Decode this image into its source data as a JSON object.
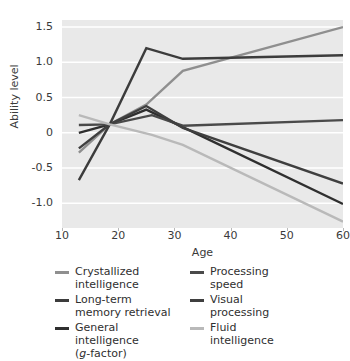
{
  "chart_data": {
    "type": "line",
    "title": "",
    "xlabel": "Age",
    "ylabel": "Ability level",
    "xlim": [
      10,
      60
    ],
    "ylim": [
      -1.35,
      1.6
    ],
    "xticks": [
      10,
      20,
      30,
      40,
      50,
      60
    ],
    "yticks": [
      1.5,
      1.0,
      0.5,
      0,
      -0.5,
      -1.0
    ],
    "ytick_labels": [
      "1.5",
      "1.0",
      "0.5",
      "0",
      "-0.5",
      "-1.0"
    ],
    "xtick_labels": [
      "10",
      "20",
      "30",
      "40",
      "50",
      "60"
    ],
    "grid": "horizontal-white-on-gray",
    "legend_position": "below-plot-two-columns",
    "plot_background": "#e9e9e9",
    "gridline_color": "#ffffff",
    "series": [
      {
        "name": "Crystallized intelligence",
        "color": "#8f8f8f",
        "x": [
          13,
          18.5,
          25,
          31.5,
          60
        ],
        "values": [
          -0.28,
          0.12,
          0.4,
          0.88,
          1.5
        ]
      },
      {
        "name": "Long-term memory retrieval",
        "color": "#3c3c3c",
        "x": [
          13,
          18.5,
          25,
          31.5,
          38,
          60
        ],
        "values": [
          -0.67,
          0.12,
          1.2,
          1.05,
          1.06,
          1.1
        ]
      },
      {
        "name": "General intelligence (g-factor)",
        "color": "#2f2f2f",
        "x": [
          13,
          18.5,
          25,
          31.5,
          60
        ],
        "values": [
          0.0,
          0.12,
          0.33,
          0.08,
          -1.01
        ]
      },
      {
        "name": "Processing speed",
        "color": "#4a4a4a",
        "x": [
          13,
          18.5,
          26,
          31.5,
          60
        ],
        "values": [
          0.11,
          0.12,
          0.25,
          0.1,
          0.18
        ]
      },
      {
        "name": "Visual processing",
        "color": "#3f3f3f",
        "x": [
          13,
          18.5,
          25,
          31.5,
          60
        ],
        "values": [
          -0.22,
          0.12,
          0.38,
          0.07,
          -0.72
        ]
      },
      {
        "name": "Fluid intelligence",
        "color": "#b9b9b9",
        "x": [
          13,
          18.5,
          26,
          31.5,
          60
        ],
        "values": [
          0.25,
          0.12,
          -0.03,
          -0.17,
          -1.26
        ]
      }
    ]
  },
  "axes": {
    "y_label": "Ability level",
    "x_label": "Age",
    "y_tick_labels": [
      "1.5",
      "1.0",
      "0.5",
      "0",
      "-0.5",
      "-1.0"
    ],
    "x_tick_labels": [
      "10",
      "20",
      "30",
      "40",
      "50",
      "60"
    ]
  },
  "legend": {
    "left_column": [
      {
        "label": "Crystallized\nintelligence",
        "color": "#8f8f8f",
        "icon": "line-swatch-icon"
      },
      {
        "label": "Long-term\nmemory retrieval",
        "color": "#3c3c3c",
        "icon": "line-swatch-icon"
      },
      {
        "label": "General\nintelligence\n(g-factor)",
        "color": "#2f2f2f",
        "icon": "line-swatch-icon",
        "italic_token": "g"
      }
    ],
    "right_column": [
      {
        "label": "Processing\nspeed",
        "color": "#4a4a4a",
        "icon": "line-swatch-icon"
      },
      {
        "label": "Visual\nprocessing",
        "color": "#3f3f3f",
        "icon": "line-swatch-icon"
      },
      {
        "label": "Fluid\nintelligence",
        "color": "#b9b9b9",
        "icon": "line-swatch-icon"
      }
    ]
  }
}
